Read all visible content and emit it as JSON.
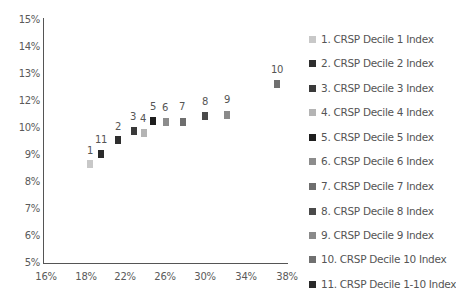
{
  "chart_data": {
    "type": "scatter",
    "title": "",
    "xlabel": "",
    "ylabel": "",
    "x_tick_labels": [
      "16%",
      "18%",
      "22%",
      "26%",
      "30%",
      "34%",
      "38%"
    ],
    "y_tick_labels": [
      "15%",
      "14%",
      "13%",
      "12%",
      "10%",
      "9%",
      "8%",
      "7%",
      "6%",
      "5%"
    ],
    "xlim": [
      16,
      38
    ],
    "ylim": [
      5,
      15
    ],
    "grid": false,
    "legend_position": "right",
    "series": [
      {
        "name": "1. CRSP Decile 1 Index",
        "label": "1",
        "x": 18.4,
        "y": 8.6,
        "color": "#c8c8c8"
      },
      {
        "name": "2. CRSP Decile 2 Index",
        "label": "2",
        "x": 21.3,
        "y": 9.5,
        "color": "#2e2e2e"
      },
      {
        "name": "3. CRSP Decile 3 Index",
        "label": "3",
        "x": 22.9,
        "y": 9.85,
        "color": "#3a3a3a"
      },
      {
        "name": "4. CRSP Decile 4 Index",
        "label": "4",
        "x": 23.9,
        "y": 9.8,
        "color": "#b4b4b4"
      },
      {
        "name": "5. CRSP Decile 5 Index",
        "label": "5",
        "x": 24.8,
        "y": 10.25,
        "color": "#1e1e1e"
      },
      {
        "name": "6. CRSP Decile 6 Index",
        "label": "6",
        "x": 26.2,
        "y": 10.2,
        "color": "#8c8c8c"
      },
      {
        "name": "7. CRSP Decile 7 Index",
        "label": "7",
        "x": 27.9,
        "y": 10.2,
        "color": "#6e6e6e"
      },
      {
        "name": "8. CRSP Decile 8 Index",
        "label": "8",
        "x": 30.0,
        "y": 10.4,
        "color": "#4a4a4a"
      },
      {
        "name": "9. CRSP Decile 9 Index",
        "label": "9",
        "x": 32.1,
        "y": 10.45,
        "color": "#8a8a8a"
      },
      {
        "name": "10. CRSP Decile 10 Index",
        "label": "10",
        "x": 36.9,
        "y": 12.6,
        "color": "#707070"
      },
      {
        "name": "11. CRSP Decile 1-10 Index",
        "label": "11",
        "x": 19.5,
        "y": 9.0,
        "color": "#2a2a2a"
      }
    ]
  },
  "plot": {
    "y_ticks": [
      {
        "label": "15%",
        "top": 14
      },
      {
        "label": "14%",
        "top": 41
      },
      {
        "label": "13%",
        "top": 68
      },
      {
        "label": "12%",
        "top": 95
      },
      {
        "label": "10%",
        "top": 122
      },
      {
        "label": "9%",
        "top": 149
      },
      {
        "label": "8%",
        "top": 176
      },
      {
        "label": "7%",
        "top": 203
      },
      {
        "label": "6%",
        "top": 230
      },
      {
        "label": "5%",
        "top": 257
      }
    ],
    "x_ticks": [
      {
        "label": "16%",
        "left": 46
      },
      {
        "label": "18%",
        "left": 86
      },
      {
        "label": "22%",
        "left": 125
      },
      {
        "label": "26%",
        "left": 165
      },
      {
        "label": "30%",
        "left": 205
      },
      {
        "label": "34%",
        "left": 246
      },
      {
        "label": "38%",
        "left": 287
      }
    ],
    "points": [
      {
        "label": "1",
        "px": 90,
        "py": 164,
        "lx": 90,
        "ly": 145,
        "color": "#c8c8c8"
      },
      {
        "label": "11",
        "px": 101,
        "py": 154,
        "lx": 101,
        "ly": 134,
        "color": "#2a2a2a"
      },
      {
        "label": "2",
        "px": 118,
        "py": 140,
        "lx": 118,
        "ly": 121,
        "color": "#2e2e2e"
      },
      {
        "label": "3",
        "px": 134,
        "py": 131,
        "lx": 133,
        "ly": 111,
        "color": "#3a3a3a"
      },
      {
        "label": "4",
        "px": 144,
        "py": 133,
        "lx": 143,
        "ly": 113,
        "color": "#b4b4b4"
      },
      {
        "label": "5",
        "px": 153,
        "py": 121,
        "lx": 153,
        "ly": 101,
        "color": "#1e1e1e"
      },
      {
        "label": "6",
        "px": 166,
        "py": 122,
        "lx": 165,
        "ly": 102,
        "color": "#8c8c8c"
      },
      {
        "label": "7",
        "px": 183,
        "py": 122,
        "lx": 182,
        "ly": 101,
        "color": "#6e6e6e"
      },
      {
        "label": "8",
        "px": 205,
        "py": 116,
        "lx": 205,
        "ly": 96,
        "color": "#4a4a4a"
      },
      {
        "label": "9",
        "px": 227,
        "py": 115,
        "lx": 227,
        "ly": 94,
        "color": "#8a8a8a"
      },
      {
        "label": "10",
        "px": 277,
        "py": 84,
        "lx": 277,
        "ly": 64,
        "color": "#707070"
      }
    ]
  },
  "legend": {
    "items": [
      {
        "label": "1. CRSP Decile 1 Index",
        "color": "#c8c8c8",
        "top": 33
      },
      {
        "label": "2. CRSP Decile 2 Index",
        "color": "#2e2e2e",
        "top": 57
      },
      {
        "label": "3. CRSP Decile 3 Index",
        "color": "#3a3a3a",
        "top": 82
      },
      {
        "label": "4. CRSP Decile 4 Index",
        "color": "#b4b4b4",
        "top": 106
      },
      {
        "label": "5. CRSP Decile 5 Index",
        "color": "#1e1e1e",
        "top": 131
      },
      {
        "label": "6. CRSP Decile 6 Index",
        "color": "#8c8c8c",
        "top": 155
      },
      {
        "label": "7. CRSP Decile 7 Index",
        "color": "#6e6e6e",
        "top": 180
      },
      {
        "label": "8. CRSP Decile 8 Index",
        "color": "#4a4a4a",
        "top": 205
      },
      {
        "label": "9. CRSP Decile 9 Index",
        "color": "#8a8a8a",
        "top": 229
      },
      {
        "label": "10. CRSP Decile 10 Index",
        "color": "#707070",
        "top": 253
      },
      {
        "label": "11. CRSP Decile 1-10 Index",
        "color": "#2a2a2a",
        "top": 278
      }
    ]
  }
}
